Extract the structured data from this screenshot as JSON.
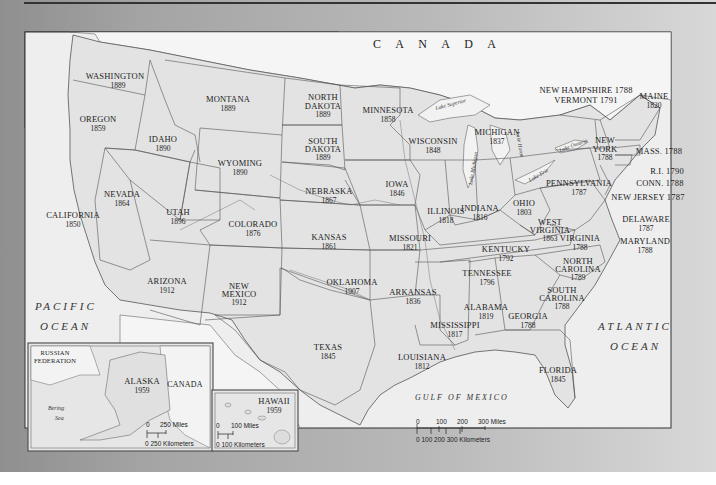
{
  "map": {
    "title": "United States Statehood Map",
    "colors": {
      "land_us": "#e4e4e4",
      "land_foreign": "#f3f3f3",
      "water": "#ececec",
      "border": "#4a4a4a",
      "frame": "#a0a0a0"
    },
    "countries": {
      "canada": "C A N A D A",
      "canada_inset": "CANADA",
      "russia_line1": "RUSSIAN",
      "russia_line2": "FEDERATION"
    },
    "water_labels": {
      "pacific_1": "PACIFIC",
      "pacific_2": "OCEAN",
      "atlantic_1": "ATLANTIC",
      "atlantic_2": "OCEAN",
      "gulf": "GULF OF MEXICO",
      "bering_1": "Bering",
      "bering_2": "Sea",
      "lake_superior": "Lake Superior",
      "lake_michigan": "Lake Michigan",
      "lake_huron": "Lake Huron",
      "lake_erie": "Lake Erie",
      "lake_ontario": "Lake Ontario"
    },
    "states": [
      {
        "name": "WASHINGTON",
        "year": "1889"
      },
      {
        "name": "OREGON",
        "year": "1859"
      },
      {
        "name": "IDAHO",
        "year": "1890"
      },
      {
        "name": "MONTANA",
        "year": "1889"
      },
      {
        "name": "WYOMING",
        "year": "1890"
      },
      {
        "name": "NORTH DAKOTA",
        "line1": "NORTH",
        "line2": "DAKOTA",
        "year": "1889"
      },
      {
        "name": "SOUTH DAKOTA",
        "line1": "SOUTH",
        "line2": "DAKOTA",
        "year": "1889"
      },
      {
        "name": "MINNESOTA",
        "year": "1858"
      },
      {
        "name": "WISCONSIN",
        "year": "1848"
      },
      {
        "name": "MICHIGAN",
        "year": "1837"
      },
      {
        "name": "NEVADA",
        "year": "1864"
      },
      {
        "name": "CALIFORNIA",
        "year": "1850"
      },
      {
        "name": "UTAH",
        "year": "1896"
      },
      {
        "name": "COLORADO",
        "year": "1876"
      },
      {
        "name": "NEBRASKA",
        "year": "1867"
      },
      {
        "name": "IOWA",
        "year": "1846"
      },
      {
        "name": "KANSAS",
        "year": "1861"
      },
      {
        "name": "ILLINOIS",
        "year": "1818"
      },
      {
        "name": "INDIANA",
        "year": "1816"
      },
      {
        "name": "OHIO",
        "year": "1803"
      },
      {
        "name": "MISSOURI",
        "year": "1821"
      },
      {
        "name": "ARIZONA",
        "year": "1912"
      },
      {
        "name": "NEW MEXICO",
        "line1": "NEW",
        "line2": "MEXICO",
        "year": "1912"
      },
      {
        "name": "OKLAHOMA",
        "year": "1907"
      },
      {
        "name": "TEXAS",
        "year": "1845"
      },
      {
        "name": "ARKANSAS",
        "year": "1836"
      },
      {
        "name": "LOUISIANA",
        "year": "1812"
      },
      {
        "name": "MISSISSIPPI",
        "year": "1817"
      },
      {
        "name": "ALABAMA",
        "year": "1819"
      },
      {
        "name": "TENNESSEE",
        "year": "1796"
      },
      {
        "name": "KENTUCKY",
        "year": "1792"
      },
      {
        "name": "GEORGIA",
        "year": "1788"
      },
      {
        "name": "FLORIDA",
        "year": "1845"
      },
      {
        "name": "SOUTH CAROLINA",
        "line1": "SOUTH",
        "line2": "CAROLINA",
        "year": "1788"
      },
      {
        "name": "NORTH CAROLINA",
        "line1": "NORTH",
        "line2": "CAROLINA",
        "year": "1789"
      },
      {
        "name": "VIRGINIA",
        "year": "1788"
      },
      {
        "name": "WEST VIRGINIA",
        "line1": "WEST",
        "line2": "VIRGINIA",
        "year": "1863"
      },
      {
        "name": "PENNSYLVANIA",
        "year": "1787"
      },
      {
        "name": "NEW YORK",
        "line1": "NEW",
        "line2": "YORK",
        "year": "1788"
      },
      {
        "name": "MAINE",
        "year": "1820"
      },
      {
        "name": "NEW HAMPSHIRE",
        "label": "NEW HAMPSHIRE 1788",
        "year": "1788"
      },
      {
        "name": "VERMONT",
        "label": "VERMONT 1791",
        "year": "1791"
      },
      {
        "name": "MASS.",
        "label": "MASS. 1788",
        "year": "1788"
      },
      {
        "name": "R.I.",
        "label": "R.I. 1790",
        "year": "1790"
      },
      {
        "name": "CONN.",
        "label": "CONN. 1788",
        "year": "1788"
      },
      {
        "name": "NEW JERSEY",
        "label": "NEW JERSEY 1787",
        "year": "1787"
      },
      {
        "name": "DELAWARE",
        "year": "1787"
      },
      {
        "name": "MARYLAND",
        "year": "1788"
      },
      {
        "name": "ALASKA",
        "year": "1959"
      },
      {
        "name": "HAWAII",
        "year": "1959"
      }
    ],
    "scales": {
      "main": {
        "miles_ticks": [
          "0",
          "100",
          "200",
          "300 Miles"
        ],
        "km_label": "0   100  200  300 Kilometers"
      },
      "alaska": {
        "miles_zero": "0",
        "miles_label": "250 Miles",
        "km_label": "0   250 Kilometers"
      },
      "hawaii": {
        "miles_zero": "0",
        "miles_label": "100 Miles",
        "km_label": "0   100 Kilometers"
      }
    }
  }
}
